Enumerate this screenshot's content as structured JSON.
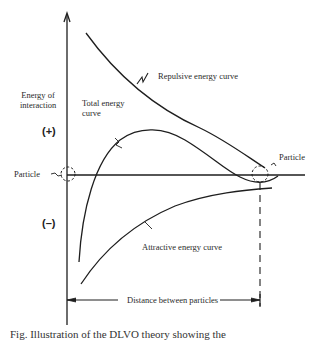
{
  "diagram": {
    "y_axis_label": "Energy of interaction",
    "y_axis_label_line1": "Energy of",
    "y_axis_label_line2": "interaction",
    "positive_sign": "(+)",
    "negative_sign": "(–)",
    "particle_left": "Particle",
    "particle_right": "Particle",
    "curves": {
      "repulsive": "Repulsive energy curve",
      "total_line1": "Total energy",
      "total_line2": "curve",
      "attractive": "Attractive energy curve"
    },
    "x_dimension_label": "Distance between particles"
  },
  "caption": "Fig. Illustration of the DLVO theory showing the"
}
